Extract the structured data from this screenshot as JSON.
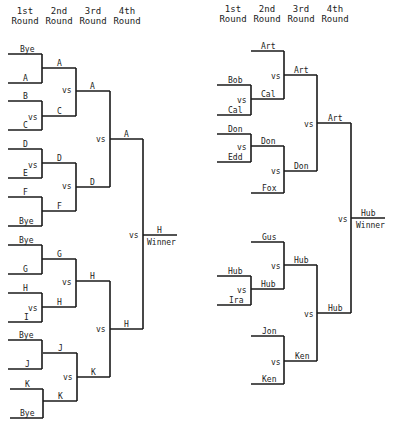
{
  "headers": {
    "left": [
      {
        "line1": "1st",
        "line2": "Round"
      },
      {
        "line1": "2nd",
        "line2": "Round"
      },
      {
        "line1": "3rd",
        "line2": "Round"
      },
      {
        "line1": "4th",
        "line2": "Round"
      }
    ],
    "right": [
      {
        "line1": "1st",
        "line2": "Round"
      },
      {
        "line1": "2nd",
        "line2": "Round"
      },
      {
        "line1": "3rd",
        "line2": "Round"
      },
      {
        "line1": "4th",
        "line2": "Round"
      }
    ]
  },
  "vs_label": "vs",
  "winner_label": "Winner",
  "left_bracket": {
    "round1": [
      "Bye",
      "A",
      "B",
      "C",
      "D",
      "E",
      "F",
      "Bye",
      "Bye",
      "G",
      "H",
      "I",
      "Bye",
      "J",
      "K",
      "Bye"
    ],
    "round2": [
      "A",
      "C",
      "D",
      "F",
      "G",
      "H",
      "J",
      "K"
    ],
    "round3": [
      "A",
      "D",
      "H",
      "K"
    ],
    "round4": [
      "A",
      "H"
    ],
    "winner": "H"
  },
  "right_bracket": {
    "round1": [
      "Bob",
      "Cal",
      "Don",
      "Edd",
      "Hub",
      "Ira"
    ],
    "round2": [
      "Art",
      "Cal",
      "Don",
      "Fox",
      "Gus",
      "Hub",
      "Jon",
      "Ken"
    ],
    "round3": [
      "Art",
      "Don",
      "Hub",
      "Ken"
    ],
    "round4": [
      "Art",
      "Hub"
    ],
    "winner": "Hub"
  }
}
